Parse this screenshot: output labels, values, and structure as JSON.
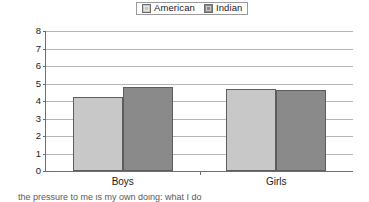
{
  "chart_data": {
    "type": "bar",
    "title": "",
    "xlabel": "",
    "ylabel": "",
    "categories": [
      "Boys",
      "Girls"
    ],
    "series": [
      {
        "name": "American",
        "color": "#c8c8c8",
        "values": [
          4.25,
          4.7
        ]
      },
      {
        "name": "Indian",
        "color": "#8a8a8a",
        "values": [
          4.8,
          4.65
        ]
      }
    ],
    "ylim": [
      0,
      8
    ],
    "yticks": [
      "0",
      "1",
      "2",
      "3",
      "4",
      "5",
      "6",
      "7",
      "8"
    ],
    "grid": "horizontal",
    "legend_position": "top-center"
  },
  "legend": {
    "entries": [
      {
        "label": "American",
        "swatch_name": "legend-swatch-american"
      },
      {
        "label": "Indian",
        "swatch_name": "legend-swatch-indian"
      }
    ]
  },
  "axis": {
    "y_tick_labels": [
      "8",
      "7",
      "6",
      "5",
      "4",
      "3",
      "2",
      "1",
      "0"
    ],
    "x_tick_labels": [
      "Boys",
      "Girls"
    ]
  },
  "caption_fragment": {
    "text": "the pressure to me is my own doing: what I do"
  }
}
